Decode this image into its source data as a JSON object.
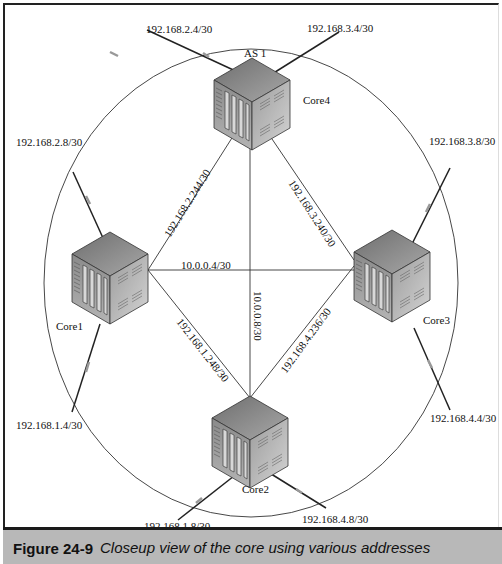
{
  "diagram": {
    "as_label": "AS 1",
    "routers": [
      {
        "id": "core4",
        "label": "Core4"
      },
      {
        "id": "core1",
        "label": "Core1"
      },
      {
        "id": "core3",
        "label": "Core3"
      },
      {
        "id": "core2",
        "label": "Core2"
      }
    ],
    "core_links": [
      {
        "from": "Core4",
        "to": "Core1",
        "subnet": "192.168.2.244/30"
      },
      {
        "from": "Core4",
        "to": "Core3",
        "subnet": "192.168.3.240/30"
      },
      {
        "from": "Core1",
        "to": "Core3",
        "subnet": "10.0.0.4/30"
      },
      {
        "from": "Core4",
        "to": "Core2",
        "subnet": "10.0.0.8/30"
      },
      {
        "from": "Core1",
        "to": "Core2",
        "subnet": "192.168.1.248/30"
      },
      {
        "from": "Core3",
        "to": "Core2",
        "subnet": "192.168.4.236/30"
      }
    ],
    "external_links": [
      {
        "router": "Core4",
        "subnet": "192.168.2.4/30"
      },
      {
        "router": "Core4",
        "subnet": "192.168.3.4/30"
      },
      {
        "router": "Core1",
        "subnet": "192.168.2.8/30"
      },
      {
        "router": "Core1",
        "subnet": "192.168.1.4/30"
      },
      {
        "router": "Core3",
        "subnet": "192.168.3.8/30"
      },
      {
        "router": "Core3",
        "subnet": "192.168.4.4/30"
      },
      {
        "router": "Core2",
        "subnet": "192.168.1.8/30"
      },
      {
        "router": "Core2",
        "subnet": "192.168.4.8/30"
      }
    ]
  },
  "caption": {
    "number": "Figure 24-9",
    "text": "Closeup view of the core using various addresses"
  },
  "colors": {
    "caption_bar": "#b8b8b8",
    "line": "#222222",
    "router_top": "#8a8a8a",
    "router_front": "#9a9a9a",
    "router_side": "#b0b0b0"
  }
}
